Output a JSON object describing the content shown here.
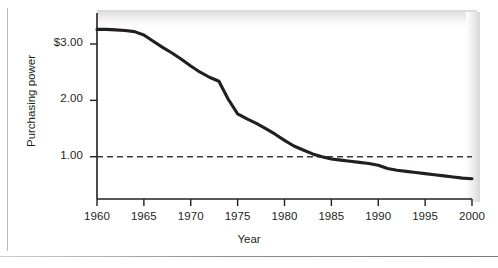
{
  "figure": {
    "yaxis_title": "Purchasing power",
    "xaxis_title": "Year"
  },
  "chart_data": {
    "type": "line",
    "title": "",
    "subtitle": "",
    "xlabel": "Year",
    "ylabel": "Purchasing power",
    "xlim": [
      1960,
      2000
    ],
    "ylim": [
      0.25,
      3.55
    ],
    "grid": false,
    "legend": null,
    "xtick_labels": [
      "1960",
      "1965",
      "1970",
      "1975",
      "1980",
      "1985",
      "1990",
      "1995",
      "2000"
    ],
    "xticks": [
      1960,
      1965,
      1970,
      1975,
      1980,
      1985,
      1990,
      1995,
      2000
    ],
    "ytick_labels": [
      "$3.00",
      "2.00",
      "1.00"
    ],
    "yticks": [
      3.0,
      2.0,
      1.0
    ],
    "series": [
      {
        "name": "Purchasing power",
        "color": "#231f20",
        "style": "solid",
        "x": [
          1960,
          1961,
          1962,
          1963,
          1964,
          1965,
          1966,
          1967,
          1968,
          1969,
          1970,
          1971,
          1972,
          1973,
          1974,
          1975,
          1976,
          1977,
          1978,
          1979,
          1980,
          1981,
          1982,
          1983,
          1984,
          1985,
          1986,
          1987,
          1988,
          1989,
          1990,
          1991,
          1992,
          1993,
          1994,
          1995,
          1996,
          1997,
          1998,
          1999,
          2000
        ],
        "values": [
          3.26,
          3.26,
          3.25,
          3.24,
          3.22,
          3.16,
          3.05,
          2.94,
          2.84,
          2.73,
          2.61,
          2.5,
          2.41,
          2.34,
          2.02,
          1.76,
          1.67,
          1.59,
          1.5,
          1.4,
          1.29,
          1.19,
          1.12,
          1.05,
          1.0,
          0.96,
          0.94,
          0.92,
          0.9,
          0.88,
          0.85,
          0.79,
          0.76,
          0.74,
          0.72,
          0.7,
          0.68,
          0.66,
          0.64,
          0.62,
          0.61
        ]
      },
      {
        "name": "Reference level",
        "color": "#3a3a3a",
        "style": "dashed",
        "x": [
          1960,
          2000
        ],
        "values": [
          1.0,
          1.0
        ]
      }
    ],
    "annotations": []
  },
  "axis_ticks_px": {
    "note": "rendered positions only"
  }
}
